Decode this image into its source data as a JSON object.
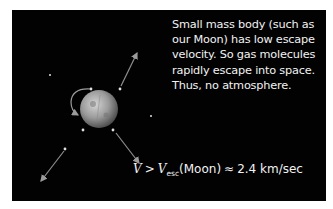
{
  "diagram": {
    "background_color": "#020202",
    "caption_lines": [
      "Small mass body (such as",
      "our Moon) has low escape",
      "velocity. So gas molecules",
      "rapidly escape into space.",
      "Thus, no atmosphere."
    ],
    "formula": {
      "lhs": "V",
      "gt": ">",
      "v_symbol": "V",
      "subscript": "esc",
      "body": "(Moon)",
      "approx": "≈",
      "value": "2.4 km/sec"
    },
    "moon": {
      "label": "moon-sphere",
      "color": "#9a9a9a"
    },
    "molecules": [
      {
        "x": 91,
        "y": 89
      },
      {
        "x": 120,
        "y": 89
      },
      {
        "x": 83,
        "y": 130
      },
      {
        "x": 113,
        "y": 130
      },
      {
        "x": 65,
        "y": 149
      },
      {
        "x": 50,
        "y": 75
      },
      {
        "x": 151,
        "y": 116
      }
    ],
    "arrows": [
      {
        "name": "arrow-up-right",
        "x1": 121,
        "y1": 86,
        "x2": 137,
        "y2": 53
      },
      {
        "name": "arrow-down-right",
        "x1": 116,
        "y1": 133,
        "x2": 139,
        "y2": 163
      },
      {
        "name": "arrow-down-left",
        "x1": 64,
        "y1": 151,
        "x2": 41,
        "y2": 181
      }
    ]
  }
}
